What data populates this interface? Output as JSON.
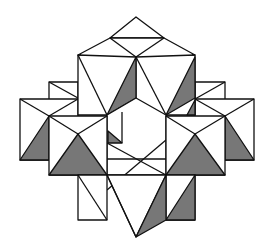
{
  "figure": {
    "colors": {
      "stroke": "#111111",
      "shade": "#777777",
      "background": "#ffffff"
    }
  }
}
